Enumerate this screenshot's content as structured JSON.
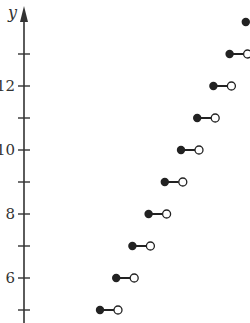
{
  "chart_data": {
    "type": "scatter",
    "subtype": "step-function",
    "title": "",
    "xlabel": "",
    "ylabel": "y",
    "ylim": [
      4.6,
      14.3
    ],
    "y_ticks": [
      5,
      6,
      7,
      8,
      9,
      10,
      11,
      12,
      13
    ],
    "y_tick_labels": [
      {
        "value": 6,
        "label": "6"
      },
      {
        "value": 8,
        "label": "8"
      },
      {
        "value": 10,
        "label": "10"
      },
      {
        "value": 12,
        "label": "12"
      }
    ],
    "steps": [
      {
        "y": 5,
        "closed_left": true,
        "open_right": true
      },
      {
        "y": 6,
        "closed_left": true,
        "open_right": true
      },
      {
        "y": 7,
        "closed_left": true,
        "open_right": true
      },
      {
        "y": 8,
        "closed_left": true,
        "open_right": true
      },
      {
        "y": 9,
        "closed_left": true,
        "open_right": true
      },
      {
        "y": 10,
        "closed_left": true,
        "open_right": true
      },
      {
        "y": 11,
        "closed_left": true,
        "open_right": true
      },
      {
        "y": 12,
        "closed_left": true,
        "open_right": true
      },
      {
        "y": 13,
        "closed_left": true,
        "open_right": true
      },
      {
        "y": 14,
        "closed_left": true,
        "open_right": false
      }
    ],
    "colors": {
      "axis": "#333333",
      "point": "#222222"
    }
  }
}
